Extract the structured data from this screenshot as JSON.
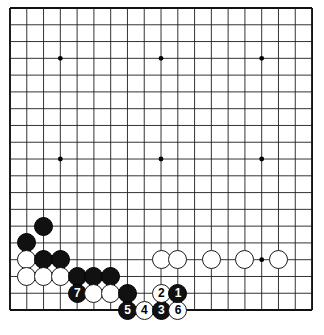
{
  "diagram": {
    "kind": "go-board-diagram",
    "board_size": 19,
    "geometry": {
      "origin_x": 10,
      "origin_y": 8,
      "spacing": 16.78,
      "stone_diameter": 19,
      "line_color": "#1d1d1d",
      "border_color": "#111111",
      "background": "#ffffff",
      "hoshi_radius": 2.4,
      "number_font_size": 12
    },
    "hoshi": [
      {
        "col": 4,
        "row": 4
      },
      {
        "col": 10,
        "row": 4
      },
      {
        "col": 16,
        "row": 4
      },
      {
        "col": 4,
        "row": 10
      },
      {
        "col": 10,
        "row": 10
      },
      {
        "col": 16,
        "row": 10
      },
      {
        "col": 4,
        "row": 16
      },
      {
        "col": 10,
        "row": 16
      },
      {
        "col": 16,
        "row": 16
      }
    ],
    "stones": [
      {
        "col": 3,
        "row": 14,
        "color": "black",
        "label": ""
      },
      {
        "col": 2,
        "row": 15,
        "color": "black",
        "label": ""
      },
      {
        "col": 2,
        "row": 16,
        "color": "white",
        "label": ""
      },
      {
        "col": 3,
        "row": 16,
        "color": "black",
        "label": ""
      },
      {
        "col": 4,
        "row": 16,
        "color": "black",
        "label": ""
      },
      {
        "col": 2,
        "row": 17,
        "color": "white",
        "label": ""
      },
      {
        "col": 3,
        "row": 17,
        "color": "white",
        "label": ""
      },
      {
        "col": 4,
        "row": 17,
        "color": "white",
        "label": ""
      },
      {
        "col": 5,
        "row": 17,
        "color": "black",
        "label": ""
      },
      {
        "col": 6,
        "row": 17,
        "color": "black",
        "label": ""
      },
      {
        "col": 7,
        "row": 17,
        "color": "black",
        "label": ""
      },
      {
        "col": 5,
        "row": 18,
        "color": "black",
        "label": "7"
      },
      {
        "col": 6,
        "row": 18,
        "color": "white",
        "label": ""
      },
      {
        "col": 7,
        "row": 18,
        "color": "white",
        "label": ""
      },
      {
        "col": 8,
        "row": 18,
        "color": "black",
        "label": ""
      },
      {
        "col": 8,
        "row": 19,
        "color": "black",
        "label": "5"
      },
      {
        "col": 9,
        "row": 19,
        "color": "white",
        "label": "4"
      },
      {
        "col": 10,
        "row": 19,
        "color": "black",
        "label": "3"
      },
      {
        "col": 11,
        "row": 19,
        "color": "white",
        "label": "6"
      },
      {
        "col": 10,
        "row": 18,
        "color": "white",
        "label": "2"
      },
      {
        "col": 11,
        "row": 18,
        "color": "black",
        "label": "1"
      },
      {
        "col": 10,
        "row": 16,
        "color": "white",
        "label": ""
      },
      {
        "col": 11,
        "row": 16,
        "color": "white",
        "label": ""
      },
      {
        "col": 13,
        "row": 16,
        "color": "white",
        "label": ""
      },
      {
        "col": 15,
        "row": 16,
        "color": "white",
        "label": ""
      },
      {
        "col": 17,
        "row": 16,
        "color": "white",
        "label": ""
      }
    ],
    "move_sequence": [
      {
        "number": "1",
        "color": "black"
      },
      {
        "number": "2",
        "color": "white"
      },
      {
        "number": "3",
        "color": "black"
      },
      {
        "number": "4",
        "color": "white"
      },
      {
        "number": "5",
        "color": "black"
      },
      {
        "number": "6",
        "color": "white"
      },
      {
        "number": "7",
        "color": "black"
      }
    ]
  }
}
